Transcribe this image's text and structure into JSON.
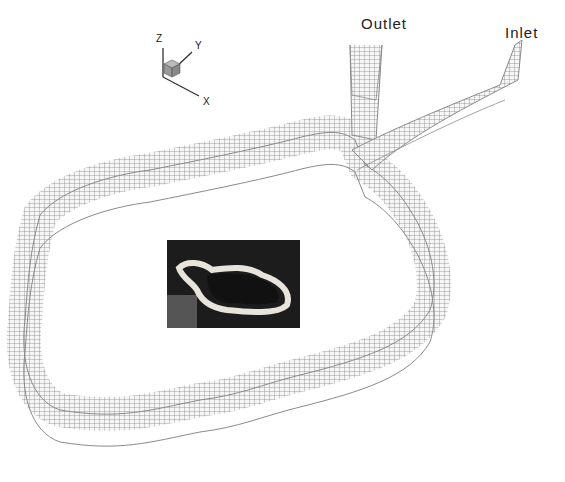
{
  "labels": {
    "outlet": "Outlet",
    "inlet": "Inlet"
  },
  "axes": {
    "x": "X",
    "y": "Y",
    "z": "Z"
  },
  "colors": {
    "mesh_line": "#777777",
    "mesh_fill": "#f4f4f4",
    "photo_bg": "#1a1a1a",
    "photo_channel": "#e8e4dc"
  }
}
